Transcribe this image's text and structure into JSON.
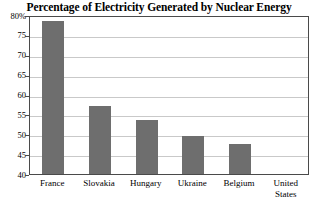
{
  "chart_data": {
    "type": "bar",
    "title": "Percentage of Electricity Generated by Nuclear Energy",
    "xlabel": "",
    "ylabel": "",
    "categories": [
      "France",
      "Slovakia",
      "Hungary",
      "Ukraine",
      "Belgium",
      "United States"
    ],
    "values": [
      78.5,
      57,
      53.5,
      49.5,
      47.5,
      null
    ],
    "ylim": [
      40,
      80
    ],
    "yticks": [
      40,
      45,
      50,
      55,
      60,
      65,
      70,
      75,
      80
    ],
    "ytick_labels": [
      "40",
      "45",
      "50",
      "55",
      "60",
      "65",
      "70",
      "75",
      "80%"
    ],
    "grid": true,
    "legend": "none",
    "bar_color": "#6e6e6e",
    "gridline_color": "#c9c9c9",
    "frame_color": "#4a4a4a",
    "background_color": "#ffffff"
  }
}
